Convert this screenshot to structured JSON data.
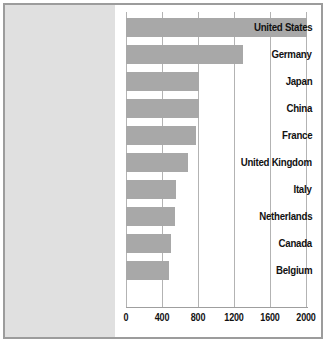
{
  "chart_data": {
    "type": "bar",
    "orientation": "horizontal",
    "title": "",
    "subtitle": "",
    "xlabel": "",
    "ylabel": "",
    "categories": [
      "United States",
      "Germany",
      "Japan",
      "China",
      "France",
      "United Kingdom",
      "Italy",
      "Netherlands",
      "Canada",
      "Belgium"
    ],
    "values": [
      2010,
      1300,
      810,
      810,
      780,
      690,
      560,
      545,
      500,
      480
    ],
    "xticks": [
      0,
      400,
      800,
      1200,
      1600,
      2000
    ],
    "xtick_labels": [
      "0",
      "400",
      "800",
      "1200",
      "1600",
      "2000"
    ],
    "xlim": [
      0,
      2000
    ],
    "grid": "vertical",
    "legend": "none",
    "colors": {
      "bar": "#a8a8a8",
      "panel": "#e0e0e0",
      "plot_background": "#ffffff",
      "gridline": "#b3b3b3",
      "border": "#9c9c9c",
      "text": "#111111"
    }
  }
}
